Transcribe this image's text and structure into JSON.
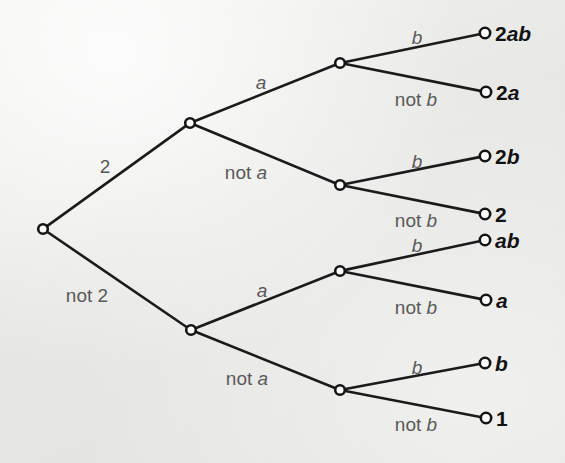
{
  "figure": {
    "type": "probability-tree-diagram",
    "background_color": "#e9e9e7",
    "edge_color": "#1b1b1b",
    "edge_label_color": "#595959",
    "leaf_label_color": "#121212",
    "node_fill": "#ffffff",
    "node_stroke": "#151515"
  },
  "nodes": [
    {
      "id": "root",
      "x": 43,
      "y": 229,
      "r": 4.8
    },
    {
      "id": "n-2",
      "x": 190,
      "y": 123,
      "r": 4.8
    },
    {
      "id": "n-not2",
      "x": 191,
      "y": 330,
      "r": 4.8
    },
    {
      "id": "n-2a",
      "x": 340,
      "y": 63,
      "r": 4.8
    },
    {
      "id": "n-2nota",
      "x": 340,
      "y": 185,
      "r": 4.8
    },
    {
      "id": "n-not2a",
      "x": 340,
      "y": 271,
      "r": 4.8
    },
    {
      "id": "n-not2nota",
      "x": 340,
      "y": 390,
      "r": 4.8
    },
    {
      "id": "leaf-2ab",
      "x": 485,
      "y": 33,
      "r": 5.2
    },
    {
      "id": "leaf-2a",
      "x": 486,
      "y": 92,
      "r": 5.2
    },
    {
      "id": "leaf-2b",
      "x": 485,
      "y": 156,
      "r": 5.2
    },
    {
      "id": "leaf-2",
      "x": 485,
      "y": 214,
      "r": 5.2
    },
    {
      "id": "leaf-ab",
      "x": 485,
      "y": 240,
      "r": 5.2
    },
    {
      "id": "leaf-a",
      "x": 486,
      "y": 300,
      "r": 5.2
    },
    {
      "id": "leaf-b",
      "x": 485,
      "y": 363,
      "r": 5.2
    },
    {
      "id": "leaf-1",
      "x": 486,
      "y": 418,
      "r": 5.2
    }
  ],
  "edges": [
    {
      "id": "e-2",
      "from": "root",
      "to": "n-2"
    },
    {
      "id": "e-not2",
      "from": "root",
      "to": "n-not2"
    },
    {
      "id": "e-2-a",
      "from": "n-2",
      "to": "n-2a"
    },
    {
      "id": "e-2-nota",
      "from": "n-2",
      "to": "n-2nota"
    },
    {
      "id": "e-not2-a",
      "from": "n-not2",
      "to": "n-not2a"
    },
    {
      "id": "e-not2-nota",
      "from": "n-not2",
      "to": "n-not2nota"
    },
    {
      "id": "e-2a-b",
      "from": "n-2a",
      "to": "leaf-2ab"
    },
    {
      "id": "e-2a-notb",
      "from": "n-2a",
      "to": "leaf-2a"
    },
    {
      "id": "e-2nota-b",
      "from": "n-2nota",
      "to": "leaf-2b"
    },
    {
      "id": "e-2nota-notb",
      "from": "n-2nota",
      "to": "leaf-2"
    },
    {
      "id": "e-not2a-b",
      "from": "n-not2a",
      "to": "leaf-ab"
    },
    {
      "id": "e-not2a-notb",
      "from": "n-not2a",
      "to": "leaf-a"
    },
    {
      "id": "e-not2nota-b",
      "from": "n-not2nota",
      "to": "leaf-b"
    },
    {
      "id": "e-not2nota-notb",
      "from": "n-not2nota",
      "to": "leaf-1"
    }
  ],
  "edge_labels": [
    {
      "id": "lbl-2",
      "text": "2",
      "roman": "2",
      "italic": "",
      "x": 105,
      "y": 166
    },
    {
      "id": "lbl-not2",
      "text": "not 2",
      "roman": "not 2",
      "italic": "",
      "x": 87,
      "y": 295
    },
    {
      "id": "lbl-a-top",
      "text": "a",
      "roman": "",
      "italic": "a",
      "x": 261,
      "y": 82
    },
    {
      "id": "lbl-nota-top",
      "text": "not a",
      "roman": "not ",
      "italic": "a",
      "x": 246,
      "y": 172
    },
    {
      "id": "lbl-a-bot",
      "text": "a",
      "roman": "",
      "italic": "a",
      "x": 262,
      "y": 290
    },
    {
      "id": "lbl-nota-bot",
      "text": "not a",
      "roman": "not ",
      "italic": "a",
      "x": 247,
      "y": 378
    },
    {
      "id": "lbl-b-1",
      "text": "b",
      "roman": "",
      "italic": "b",
      "x": 417,
      "y": 37
    },
    {
      "id": "lbl-notb-1",
      "text": "not b",
      "roman": "not ",
      "italic": "b",
      "x": 416,
      "y": 99
    },
    {
      "id": "lbl-b-2",
      "text": "b",
      "roman": "",
      "italic": "b",
      "x": 417,
      "y": 161
    },
    {
      "id": "lbl-notb-2",
      "text": "not b",
      "roman": "not ",
      "italic": "b",
      "x": 416,
      "y": 220
    },
    {
      "id": "lbl-b-3",
      "text": "b",
      "roman": "",
      "italic": "b",
      "x": 417,
      "y": 245
    },
    {
      "id": "lbl-notb-3",
      "text": "not b",
      "roman": "not ",
      "italic": "b",
      "x": 416,
      "y": 307
    },
    {
      "id": "lbl-b-4",
      "text": "b",
      "roman": "",
      "italic": "b",
      "x": 417,
      "y": 367
    },
    {
      "id": "lbl-notb-4",
      "text": "not b",
      "roman": "not ",
      "italic": "b",
      "x": 416,
      "y": 424
    }
  ],
  "leaf_labels": [
    {
      "id": "out-2ab",
      "text": "2ab",
      "roman": "2",
      "italic": "ab",
      "x": 495,
      "y": 33
    },
    {
      "id": "out-2a",
      "text": "2a",
      "roman": "2",
      "italic": "a",
      "x": 496,
      "y": 92
    },
    {
      "id": "out-2b",
      "text": "2b",
      "roman": "2",
      "italic": "b",
      "x": 495,
      "y": 156
    },
    {
      "id": "out-2",
      "text": "2",
      "roman": "2",
      "italic": "",
      "x": 495,
      "y": 214
    },
    {
      "id": "out-ab",
      "text": "ab",
      "roman": "",
      "italic": "ab",
      "x": 495,
      "y": 240
    },
    {
      "id": "out-a",
      "text": "a",
      "roman": "",
      "italic": "a",
      "x": 496,
      "y": 300
    },
    {
      "id": "out-b",
      "text": "b",
      "roman": "",
      "italic": "b",
      "x": 495,
      "y": 363
    },
    {
      "id": "out-1",
      "text": "1",
      "roman": "1",
      "italic": "",
      "x": 496,
      "y": 418
    }
  ]
}
